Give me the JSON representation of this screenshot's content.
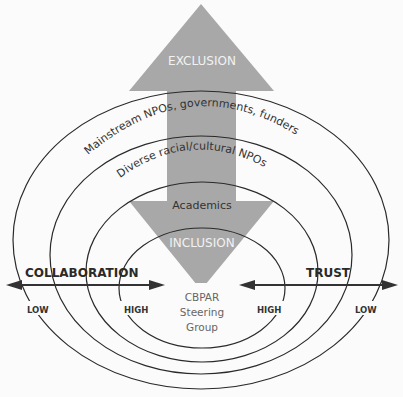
{
  "diagram": {
    "arrow_top_label": "EXCLUSION",
    "arrow_bottom_label": "INCLUSION",
    "rings": [
      {
        "label": "Mainstream NPOs, governments, funders"
      },
      {
        "label": "Diverse racial/cultural NPOs"
      },
      {
        "label": "Academics"
      },
      {
        "label": "CBPAR Steering Group"
      }
    ],
    "center": {
      "line1": "CBPAR",
      "line2": "Steering",
      "line3": "Group"
    },
    "left_axis": {
      "title": "COLLABORATION",
      "low": "LOW",
      "high": "HIGH"
    },
    "right_axis": {
      "title": "TRUST",
      "low": "LOW",
      "high": "HIGH"
    },
    "colors": {
      "arrow": "#a8a8a8",
      "arrow_text": "#f2f2f2",
      "line": "#2a2a2a",
      "text": "#333333",
      "center_text": "#666666"
    }
  }
}
